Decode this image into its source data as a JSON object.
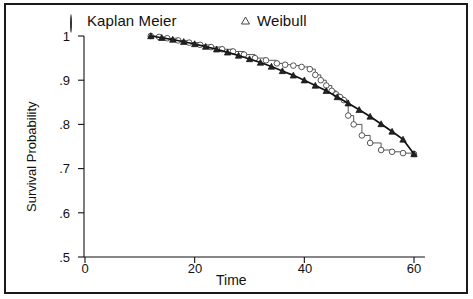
{
  "chart_data": {
    "type": "line",
    "title": "",
    "subtitle": "",
    "xlabel": "Time",
    "ylabel": "Survival Probability",
    "xlim": [
      0,
      62
    ],
    "ylim": [
      0.5,
      1.0
    ],
    "grid": false,
    "legend_position": "top",
    "xticks": [
      0,
      20,
      40,
      60
    ],
    "xtick_labels": [
      "0",
      "20",
      "40",
      "60"
    ],
    "yticks": [
      0.5,
      0.6,
      0.7,
      0.8,
      0.9,
      1.0
    ],
    "ytick_labels": [
      ".5",
      ".6",
      ".7",
      ".8",
      ".9",
      "1"
    ],
    "series": [
      {
        "name": "Kaplan Meier",
        "marker": "circle",
        "style": "step",
        "color": "#444444",
        "x": [
          12,
          13.5,
          15,
          17,
          19,
          21,
          23,
          25,
          27,
          29,
          31,
          33,
          35,
          36.5,
          38,
          39.5,
          41,
          42,
          43,
          44,
          45,
          45.8,
          46.5,
          47.2,
          48,
          49,
          50.5,
          52,
          54,
          56,
          58,
          60
        ],
        "y": [
          1.0,
          0.998,
          0.995,
          0.99,
          0.985,
          0.98,
          0.975,
          0.97,
          0.965,
          0.958,
          0.95,
          0.945,
          0.938,
          0.935,
          0.933,
          0.93,
          0.925,
          0.912,
          0.9,
          0.888,
          0.876,
          0.868,
          0.862,
          0.855,
          0.82,
          0.8,
          0.775,
          0.758,
          0.742,
          0.738,
          0.735,
          0.733
        ]
      },
      {
        "name": "Weibull",
        "marker": "triangle",
        "style": "line",
        "color": "#111111",
        "x": [
          12,
          14,
          16,
          18,
          20,
          22,
          24,
          26,
          28,
          30,
          32,
          34,
          36,
          38,
          40,
          42,
          44,
          46,
          48,
          50,
          52,
          54,
          56,
          58,
          60
        ],
        "y": [
          1.0,
          0.996,
          0.992,
          0.987,
          0.982,
          0.976,
          0.97,
          0.963,
          0.956,
          0.948,
          0.94,
          0.931,
          0.921,
          0.911,
          0.9,
          0.888,
          0.876,
          0.862,
          0.848,
          0.833,
          0.818,
          0.801,
          0.784,
          0.766,
          0.733
        ]
      }
    ]
  },
  "legend": {
    "items": [
      {
        "label": "Kaplan Meier",
        "marker": "circle"
      },
      {
        "label": "Weibull",
        "marker": "triangle"
      }
    ]
  },
  "axes": {
    "ylabel": "Survival Probability",
    "xlabel": "Time",
    "ytick_labels": [
      ".5",
      ".6",
      ".7",
      ".8",
      ".9",
      "1"
    ],
    "xtick_labels": [
      "0",
      "20",
      "40",
      "60"
    ]
  }
}
